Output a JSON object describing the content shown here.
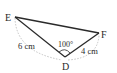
{
  "diagram": {
    "type": "triangle",
    "vertices": {
      "E": {
        "label": "E"
      },
      "F": {
        "label": "F"
      },
      "D": {
        "label": "D"
      }
    },
    "sides": {
      "ED": {
        "label": "6 cm"
      },
      "DF": {
        "label": "4 cm"
      }
    },
    "angles": {
      "D": {
        "label": "100°"
      }
    },
    "colors": {
      "line": "#2a2a2a",
      "dashed_arc": "#bdbdbd"
    }
  }
}
